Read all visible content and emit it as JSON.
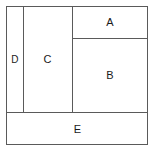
{
  "diagram": {
    "type": "rectangle-partition",
    "canvas": {
      "width": 157,
      "height": 153,
      "background_color": "#ffffff"
    },
    "style": {
      "line_color": "#5a5a5a",
      "line_width": 1,
      "fill_color": "#ffffff",
      "label_color": "#1a1a1a",
      "label_font_size": 11
    },
    "outer_frame": {
      "name": "bounding-rectangle",
      "x": 6,
      "y": 6,
      "width": 142,
      "height": 139
    },
    "regions": [
      {
        "id": "A",
        "label": "A",
        "x": 72,
        "y": 7,
        "width": 76,
        "height": 31,
        "label_x": 103,
        "label_y": 21
      },
      {
        "id": "B",
        "label": "B",
        "x": 72,
        "y": 38,
        "width": 76,
        "height": 74,
        "label_x": 105,
        "label_y": 80
      },
      {
        "id": "C",
        "label": "C",
        "x": 23,
        "y": 7,
        "width": 49,
        "height": 105,
        "label_x": 49,
        "label_y": 66
      },
      {
        "id": "D",
        "label": "D",
        "x": 7,
        "y": 7,
        "width": 16,
        "height": 105,
        "label_x": 13,
        "label_y": 66
      },
      {
        "id": "E",
        "label": "E",
        "x": 7,
        "y": 113,
        "width": 141,
        "height": 32,
        "label_x": 78,
        "label_y": 131
      }
    ],
    "partition_lines": [
      {
        "name": "divider-d-c",
        "orientation": "vertical",
        "x": 23,
        "y1": 6,
        "y2": 112
      },
      {
        "name": "divider-c-right",
        "orientation": "vertical",
        "x": 72,
        "y1": 6,
        "y2": 112
      },
      {
        "name": "divider-a-b",
        "orientation": "horizontal",
        "y": 38,
        "x1": 72,
        "x2": 148
      },
      {
        "name": "divider-above-e",
        "orientation": "horizontal",
        "y": 112,
        "x1": 6,
        "x2": 148
      }
    ]
  }
}
